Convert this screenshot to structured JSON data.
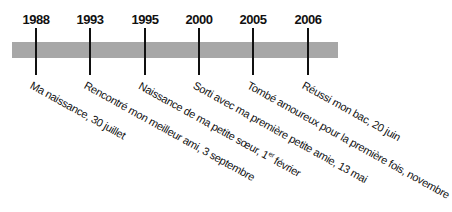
{
  "timeline": {
    "bar_color": "#a7a7a7",
    "events": [
      {
        "year": "1988",
        "label": "Ma naissance, 30 juillet"
      },
      {
        "year": "1993",
        "label": "Rencontré mon meilleur ami, 3 septembre"
      },
      {
        "year": "1995",
        "label_pre": "Naissance de ma petite sœur, 1",
        "label_sup": "er",
        "label_post": " février"
      },
      {
        "year": "2000",
        "label": "Sorti avec ma première petite amie, 13 mai"
      },
      {
        "year": "2005",
        "label": "Tombé amoureux pour la première fois, novembre"
      },
      {
        "year": "2006",
        "label": "Réussi mon bac, 20 juin"
      }
    ]
  }
}
